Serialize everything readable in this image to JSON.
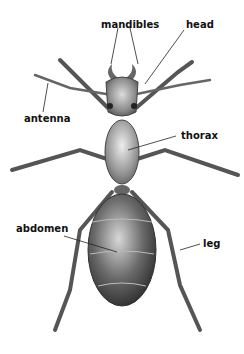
{
  "diagram": {
    "labels": [
      {
        "id": "mandibles",
        "text": "mandibles"
      },
      {
        "id": "head",
        "text": "head"
      },
      {
        "id": "antenna",
        "text": "antenna"
      },
      {
        "id": "thorax",
        "text": "thorax"
      },
      {
        "id": "abdomen",
        "text": "abdomen"
      },
      {
        "id": "leg",
        "text": "leg"
      }
    ]
  }
}
